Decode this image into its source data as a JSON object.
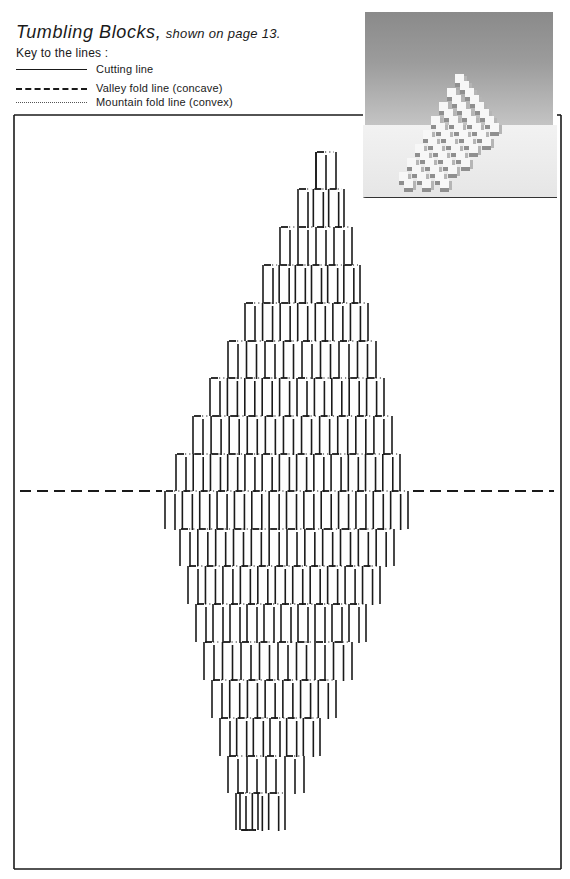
{
  "title": {
    "main": "Tumbling Blocks,",
    "sub": "shown on page 13."
  },
  "key": {
    "heading": "Key to the lines :",
    "items": [
      {
        "type": "cut",
        "label": "Cutting line"
      },
      {
        "type": "valley",
        "label": "Valley fold line (concave)"
      },
      {
        "type": "mountain",
        "label": "Mountain fold line (convex)"
      }
    ]
  },
  "photo": {
    "alt": "Photograph of the finished Tumbling Blocks pop-up card"
  },
  "pattern": {
    "frame": {
      "x1": 14,
      "y1": 115,
      "x2": 561,
      "y2": 869,
      "photo_gap_x": 363
    },
    "fold_line_y": 491,
    "fold_left_end": 165,
    "fold_right_start": 410,
    "column_pitch": 17.6,
    "rows": [
      {
        "y": 152,
        "x0": 316,
        "x1": 336
      },
      {
        "y": 189,
        "x0": 298,
        "x1": 344
      },
      {
        "y": 227,
        "x0": 280,
        "x1": 352
      },
      {
        "y": 265,
        "x0": 263,
        "x1": 360
      },
      {
        "y": 303,
        "x0": 245,
        "x1": 368
      },
      {
        "y": 341,
        "x0": 228,
        "x1": 376
      },
      {
        "y": 378,
        "x0": 210,
        "x1": 384
      },
      {
        "y": 416,
        "x0": 193,
        "x1": 392
      },
      {
        "y": 454,
        "x0": 176,
        "x1": 400
      },
      {
        "y": 491,
        "x0": 165,
        "x1": 408
      },
      {
        "y": 529,
        "x0": 180,
        "x1": 394
      },
      {
        "y": 566,
        "x0": 188,
        "x1": 380
      },
      {
        "y": 604,
        "x0": 196,
        "x1": 366
      },
      {
        "y": 642,
        "x0": 204,
        "x1": 352
      },
      {
        "y": 680,
        "x0": 212,
        "x1": 336
      },
      {
        "y": 718,
        "x0": 220,
        "x1": 320
      },
      {
        "y": 756,
        "x0": 228,
        "x1": 304
      },
      {
        "y": 793,
        "x0": 236,
        "x1": 285
      },
      {
        "y": 830,
        "x0": 240,
        "x1": 258
      }
    ]
  }
}
